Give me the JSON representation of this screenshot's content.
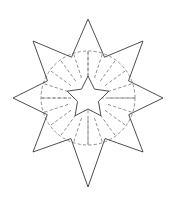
{
  "figure": {
    "background_color": "#ffffff",
    "solid_line_color": "#3a3a3a",
    "dashed_line_color": "#6b6b6b",
    "canvas": {
      "width": 176,
      "height": 203
    },
    "center": {
      "x": 88,
      "y": 98
    },
    "outer_star": {
      "name": "eight-pointed-star",
      "points": 8,
      "tip_radius_cardinal": 79,
      "tip_radius_diagonal": 78,
      "bottom_tip_extended_y": 187,
      "valley_radius": 44,
      "tips": [
        {
          "label": "top",
          "x": 88,
          "y": 19
        },
        {
          "label": "upper-right",
          "x": 143,
          "y": 41
        },
        {
          "label": "right",
          "x": 163,
          "y": 98
        },
        {
          "label": "lower-right",
          "x": 143,
          "y": 152
        },
        {
          "label": "bottom",
          "x": 88,
          "y": 187
        },
        {
          "label": "lower-left",
          "x": 33,
          "y": 152
        },
        {
          "label": "left",
          "x": 13,
          "y": 98
        },
        {
          "label": "upper-left",
          "x": 33,
          "y": 41
        }
      ]
    },
    "dashed_circle": {
      "name": "construction-circle",
      "center_x": 88,
      "center_y": 98,
      "radius": 47
    },
    "radial_spokes": {
      "name": "radial-construction-lines",
      "count": 20,
      "inner_radius": 21,
      "outer_radius": 47
    },
    "inner_star": {
      "name": "five-pointed-star",
      "points": 5,
      "outer_radius": 22,
      "inner_radius": 11,
      "rotation_degrees": -90,
      "fill": "#ffffff"
    }
  }
}
